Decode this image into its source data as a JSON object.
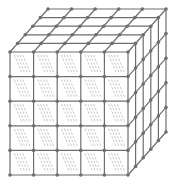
{
  "diagram": {
    "title": "",
    "type": "cube-lattice",
    "grid_divisions": 5,
    "front_face": {
      "x": 10,
      "y": 52,
      "width": 118,
      "height": 123
    },
    "depth_offset": {
      "dx": 38,
      "dy": -43
    },
    "colors": {
      "background": "#ffffff",
      "edge": "#6e6e6e",
      "node": "#6e6e6e",
      "hatch": "#b8b8b8"
    },
    "node_radius": 1.8,
    "edge_width": 1.2,
    "hatch_per_cell": 4
  }
}
